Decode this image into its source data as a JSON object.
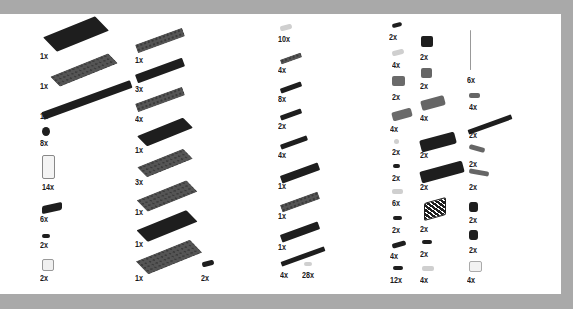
{
  "colors": {
    "background": "#a9a9a9",
    "panel": "#ffffff",
    "dark_part": "#1e1e1e",
    "grey_part": "#555555",
    "light_part": "#cfcfcf"
  },
  "columns": [
    {
      "name": "column-1",
      "items": [
        {
          "qty": "1x",
          "part": "large-plate-dark"
        },
        {
          "qty": "1x",
          "part": "large-plate-grey"
        },
        {
          "qty": "1x",
          "part": "long-plate-dark"
        },
        {
          "qty": "8x",
          "part": "round-tile-dark"
        },
        {
          "qty": "14x",
          "part": "window-frame-clear"
        },
        {
          "qty": "6x",
          "part": "bracket-dark"
        },
        {
          "qty": "2x",
          "part": "clip-dark"
        },
        {
          "qty": "2x",
          "part": "light-brick-clear"
        }
      ]
    },
    {
      "name": "column-2",
      "items": [
        {
          "qty": "1x",
          "part": "plate-grey"
        },
        {
          "qty": "3x",
          "part": "plate-dark"
        },
        {
          "qty": "4x",
          "part": "plate-grey"
        },
        {
          "qty": "1x",
          "part": "wide-plate-dark"
        },
        {
          "qty": "3x",
          "part": "wide-plate-grey"
        },
        {
          "qty": "1x",
          "part": "wide-plate-grey"
        },
        {
          "qty": "1x",
          "part": "wide-plate-dark"
        },
        {
          "qty": "1x",
          "part": "wide-plate-grey"
        },
        {
          "qty": "2x",
          "part": "small-tile-dark"
        }
      ]
    },
    {
      "name": "column-3",
      "items": [
        {
          "qty": "10x",
          "part": "tile-clear"
        },
        {
          "qty": "4x",
          "part": "plate-grey"
        },
        {
          "qty": "8x",
          "part": "plate-dark"
        },
        {
          "qty": "2x",
          "part": "plate-dark"
        },
        {
          "qty": "4x",
          "part": "long-plate-dark"
        },
        {
          "qty": "1x",
          "part": "plate-dark"
        },
        {
          "qty": "1x",
          "part": "plate-grey"
        },
        {
          "qty": "1x",
          "part": "plate-dark"
        },
        {
          "qty": "4x",
          "part": "long-plate-dark"
        },
        {
          "qty": "28x",
          "part": "stud-clear"
        }
      ]
    },
    {
      "name": "column-4",
      "items": [
        {
          "qty": "2x",
          "part": "tile-dark"
        },
        {
          "qty": "4x",
          "part": "tile-clear"
        },
        {
          "qty": "2x",
          "part": "slope-grey"
        },
        {
          "qty": "4x",
          "part": "slope-long-grey"
        },
        {
          "qty": "2x",
          "part": "round-clear"
        },
        {
          "qty": "2x",
          "part": "tile-dark"
        },
        {
          "qty": "6x",
          "part": "tile-clear"
        },
        {
          "qty": "2x",
          "part": "tile-dark"
        },
        {
          "qty": "4x",
          "part": "plate-dark"
        },
        {
          "qty": "12x",
          "part": "tile-dark"
        }
      ]
    },
    {
      "name": "column-5",
      "items": [
        {
          "qty": "2x",
          "part": "brick-dark"
        },
        {
          "qty": "2x",
          "part": "brick-grey"
        },
        {
          "qty": "4x",
          "part": "brick-long-grey"
        },
        {
          "qty": "2x",
          "part": "brick-long-dark"
        },
        {
          "qty": "2x",
          "part": "brick-long-dark"
        },
        {
          "qty": "2x",
          "part": "fence-dark"
        },
        {
          "qty": "2x",
          "part": "tile-dark"
        },
        {
          "qty": "4x",
          "part": "tile-clear"
        }
      ]
    },
    {
      "name": "column-6",
      "items": [
        {
          "qty": "6x",
          "part": "antenna-clear"
        },
        {
          "qty": "4x",
          "part": "tile-grey"
        },
        {
          "qty": "2x",
          "part": "long-plate-dark"
        },
        {
          "qty": "2x",
          "part": "wedge-grey"
        },
        {
          "qty": "2x",
          "part": "wedge-grey"
        },
        {
          "qty": "2x",
          "part": "round-brick-dark"
        },
        {
          "qty": "2x",
          "part": "round-brick-dark"
        },
        {
          "qty": "4x",
          "part": "light-brick-clear"
        }
      ]
    }
  ]
}
